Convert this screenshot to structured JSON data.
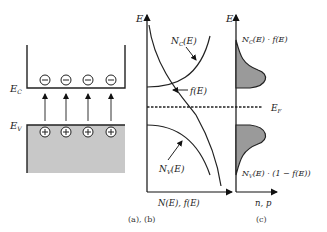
{
  "panel_a": {
    "ec_label": "E",
    "ec_sub": "C",
    "ev_label": "E",
    "ev_sub": "V",
    "electron_symbol": "−",
    "hole_symbol": "+",
    "electron_count": 4,
    "hole_count": 4,
    "valence_fill": "#c8c8c8"
  },
  "panel_b": {
    "axis_y_label": "E",
    "axis_x_label": "N(E), f(E)",
    "nc_label": "N",
    "nc_sub": "C",
    "nc_arg": "(E)",
    "fe_label": "f(E)",
    "nv_label": "N",
    "nv_sub": "V",
    "nv_arg": "(E)"
  },
  "panel_c": {
    "axis_y_label": "E",
    "axis_x_label": "n, p",
    "top_label_n": "N",
    "top_label_sub": "C",
    "top_label_rest": "(E) · f(E)",
    "bottom_label_n": "N",
    "bottom_label_sub": "V",
    "bottom_label_rest": "(E) · (1 − f(E))",
    "ef_label": "E",
    "ef_sub": "F",
    "fill": "#9a9a9a"
  },
  "captions": {
    "ab": "(a),  (b)",
    "c": "(c)"
  }
}
